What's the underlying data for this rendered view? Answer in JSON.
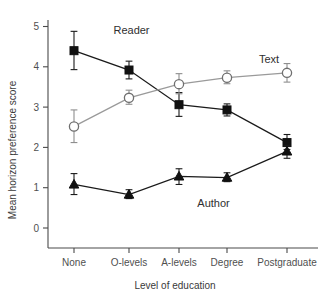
{
  "chart_data": {
    "type": "line",
    "title": "",
    "xlabel": "Level of education",
    "ylabel": "Mean horizon preference score",
    "categories": [
      "None",
      "O-levels",
      "A-levels",
      "Degree",
      "Postgraduate"
    ],
    "ylim": [
      0,
      5
    ],
    "yticks": [
      0,
      1,
      2,
      3,
      4,
      5
    ],
    "ytick_labels": [
      "0",
      "1",
      "2",
      "3",
      "4",
      "5"
    ],
    "grid": false,
    "legend_position": "inline-annotations",
    "series": [
      {
        "name": "Reader",
        "marker": "filled-square",
        "color": "#111111",
        "values": [
          4.4,
          3.92,
          3.06,
          2.93,
          2.12
        ],
        "err_low": [
          3.93,
          3.7,
          2.77,
          2.78,
          1.95
        ],
        "err_high": [
          4.88,
          4.14,
          3.36,
          3.08,
          2.32
        ]
      },
      {
        "name": "Text",
        "marker": "open-circle",
        "color": "#8e8e8e",
        "values": [
          2.52,
          3.23,
          3.57,
          3.73,
          3.85
        ],
        "err_low": [
          2.12,
          3.07,
          3.33,
          3.58,
          3.62
        ],
        "err_high": [
          2.93,
          3.42,
          3.83,
          3.9,
          4.08
        ]
      },
      {
        "name": "Author",
        "marker": "filled-triangle",
        "color": "#111111",
        "values": [
          1.08,
          0.83,
          1.28,
          1.25,
          1.9
        ],
        "err_low": [
          0.83,
          0.73,
          1.08,
          1.15,
          1.73
        ],
        "err_high": [
          1.35,
          0.95,
          1.47,
          1.37,
          2.05
        ]
      }
    ],
    "annotations": [
      {
        "text": "Reader",
        "x": 1.05,
        "y": 4.82
      },
      {
        "text": "Text",
        "x": 3.7,
        "y": 4.1
      },
      {
        "text": "Author",
        "x": 2.72,
        "y": 0.52
      }
    ]
  }
}
